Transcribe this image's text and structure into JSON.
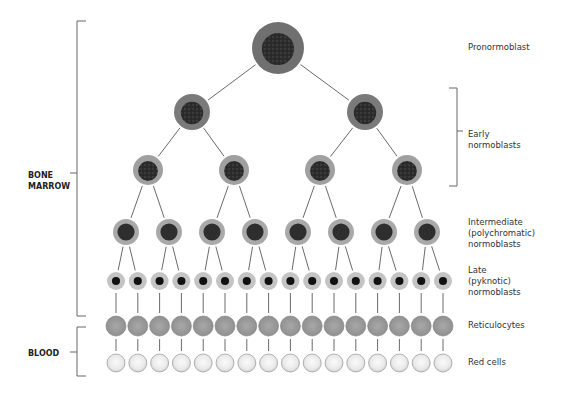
{
  "diagram": {
    "stages": [
      {
        "id": "pronormoblast",
        "label": "Pronormoblast",
        "count": 1,
        "y": 48,
        "r": 26,
        "label_y": 42
      },
      {
        "id": "early-1",
        "label": "",
        "count": 2,
        "y": 112,
        "r": 18
      },
      {
        "id": "early-2",
        "label": "Early\nnormoblasts",
        "count": 4,
        "y": 170,
        "r": 15,
        "label_y": 129
      },
      {
        "id": "intermediate",
        "label": "Intermediate\n(polychromatic)\nnormoblasts",
        "count": 8,
        "y": 232,
        "r": 13,
        "label_y": 217
      },
      {
        "id": "late",
        "label": "Late\n(pyknotic)\nnormoblasts",
        "count": 16,
        "y": 281,
        "r": 9,
        "label_y": 265
      },
      {
        "id": "reticulocytes",
        "label": "Reticulocytes",
        "count": 16,
        "y": 326,
        "r": 10,
        "label_y": 321
      },
      {
        "id": "red-cells",
        "label": "Red cells",
        "count": 16,
        "y": 363,
        "r": 9,
        "label_y": 358
      }
    ],
    "labels": {
      "pronormoblast": "Pronormoblast",
      "early": "Early\nnormoblasts",
      "intermediate": "Intermediate\n(polychromatic)\nnormoblasts",
      "late": "Late\n(pyknotic)\nnormoblasts",
      "reticulocytes": "Reticulocytes",
      "red_cells": "Red cells"
    },
    "regions": {
      "bone_marrow": "BONE\nMARROW",
      "blood": "BLOOD"
    },
    "colors": {
      "blast_cytoplasm": "#6e6e6e",
      "blast_nucleus": "#2e2e2e",
      "intermediate_cytoplasm": "#a9a9a9",
      "late_cytoplasm": "#c4c4c4",
      "late_nucleus": "#111111",
      "reticulocyte": "#9a9a9a",
      "red_cell": "#ececec",
      "line": "#6a6a6a"
    }
  }
}
